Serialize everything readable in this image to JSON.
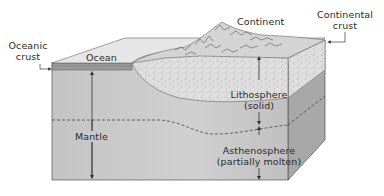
{
  "diagram": {
    "type": "block-diagram",
    "labels": {
      "oceanic_crust_line1": "Oceanic",
      "oceanic_crust_line2": "crust",
      "ocean": "Ocean",
      "continent": "Continent",
      "continental_crust_line1": "Continental",
      "continental_crust_line2": "crust",
      "mantle": "Mantle",
      "lithosphere_line1": "Lithosphere",
      "lithosphere_line2": "(solid)",
      "asthenosphere_line1": "Asthenosphere",
      "asthenosphere_line2": "(partially molten)"
    },
    "colors": {
      "front_face": "#c9c9c9",
      "right_face": "#a6a6a6",
      "ocean_top": "#e6e6e6",
      "continental_crust": "#dcdcdc",
      "oceanic_crust": "#9a9a9a",
      "outline": "#555555",
      "text": "#2a2a2a"
    }
  }
}
